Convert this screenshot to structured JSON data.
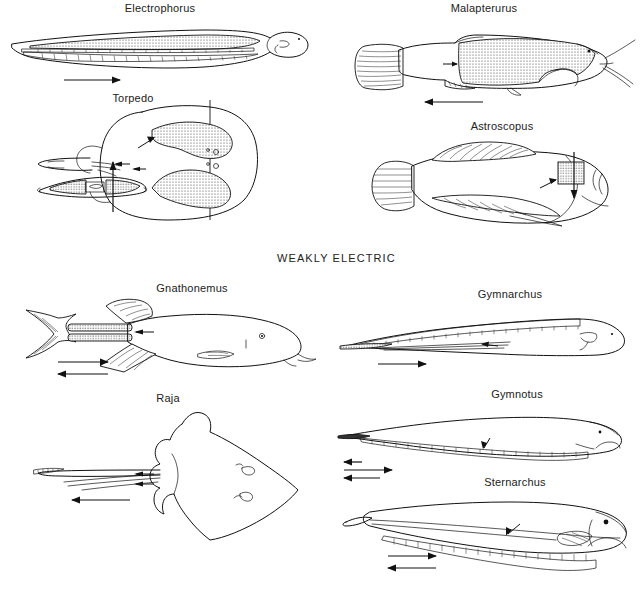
{
  "figure": {
    "title_visible": false,
    "section_header": "WEAKLY ELECTRIC",
    "background_color": "#ffffff",
    "ink_color": "#111111",
    "organ_fill_pattern": "stipple"
  },
  "groups": [
    {
      "id": "strongly-electric",
      "header_shown": false,
      "panels": [
        {
          "id": "electrophorus",
          "label": "Electrophorus",
          "view": "lateral",
          "organ_description": "large stippled main electric organ running body length with thin hatched Sachs and Hunter organs below",
          "arrows": [
            {
              "direction": "right",
              "length": "medium",
              "count": 1
            }
          ]
        },
        {
          "id": "malapterurus",
          "label": "Malapterurus",
          "view": "lateral",
          "organ_description": "large stippled electric organ sheath covering trunk",
          "arrows": [
            {
              "direction": "right",
              "length": "short",
              "count": 1
            },
            {
              "direction": "left",
              "length": "long",
              "count": 1
            }
          ]
        },
        {
          "id": "torpedo",
          "label": "Torpedo",
          "view": "dorsal and transverse section",
          "organ_description": "paired kidney-shaped stippled electric organs either side of midline",
          "arrows": [
            {
              "direction": "up",
              "length": "medium",
              "count": 1
            },
            {
              "direction": "left",
              "length": "short",
              "count": 2
            }
          ]
        },
        {
          "id": "astroscopus",
          "label": "Astroscopus",
          "view": "lateral",
          "organ_description": "small stippled square electric organ behind eye",
          "arrows": [
            {
              "direction": "down",
              "length": "short",
              "count": 1
            },
            {
              "direction": "left",
              "length": "short",
              "count": 1
            }
          ]
        }
      ]
    },
    {
      "id": "weakly-electric",
      "header_shown": true,
      "panels": [
        {
          "id": "gnathonemus",
          "label": "Gnathonemus",
          "view": "lateral",
          "organ_description": "short stippled electric organ in caudal peduncle",
          "arrows": [
            {
              "direction": "right",
              "length": "medium",
              "count": 1
            },
            {
              "direction": "left",
              "length": "medium",
              "count": 1
            }
          ]
        },
        {
          "id": "gymnarchus",
          "label": "Gymnarchus",
          "view": "lateral",
          "organ_description": "elongate hatched electric organ along tail filament",
          "arrows": [
            {
              "direction": "right",
              "length": "medium",
              "count": 1
            }
          ]
        },
        {
          "id": "raja",
          "label": "Raja",
          "view": "dorsal",
          "organ_description": "paired electric organs in slender tail",
          "arrows": [
            {
              "direction": "left",
              "length": "short",
              "count": 2
            },
            {
              "direction": "left",
              "length": "long",
              "count": 1
            }
          ]
        },
        {
          "id": "gymnotus",
          "label": "Gymnotus",
          "view": "lateral",
          "organ_description": "long hatched electric organ along ventral body margin",
          "arrows": [
            {
              "direction": "left",
              "length": "short",
              "count": 1
            },
            {
              "direction": "right",
              "length": "long",
              "count": 1
            },
            {
              "direction": "left",
              "length": "medium",
              "count": 1
            }
          ]
        },
        {
          "id": "sternarchus",
          "label": "Sternarchus",
          "view": "lateral",
          "organ_description": "long hatched electric organ along ventral margin with filamentous tail",
          "arrows": [
            {
              "direction": "right",
              "length": "medium",
              "count": 1
            },
            {
              "direction": "left",
              "length": "medium",
              "count": 1
            }
          ]
        }
      ]
    }
  ]
}
